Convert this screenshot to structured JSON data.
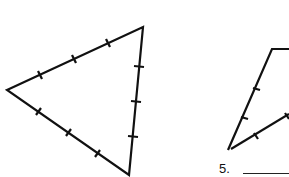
{
  "problems": [
    {
      "number": "",
      "shape": "equilateral-triangle",
      "tick_marks_per_side": 3,
      "answer": ""
    },
    {
      "number": "5.",
      "shape": "isosceles-figure-partial",
      "tick_marks_per_side": 2,
      "answer": ""
    }
  ],
  "colors": {
    "stroke": "#111111",
    "background": "#ffffff"
  }
}
